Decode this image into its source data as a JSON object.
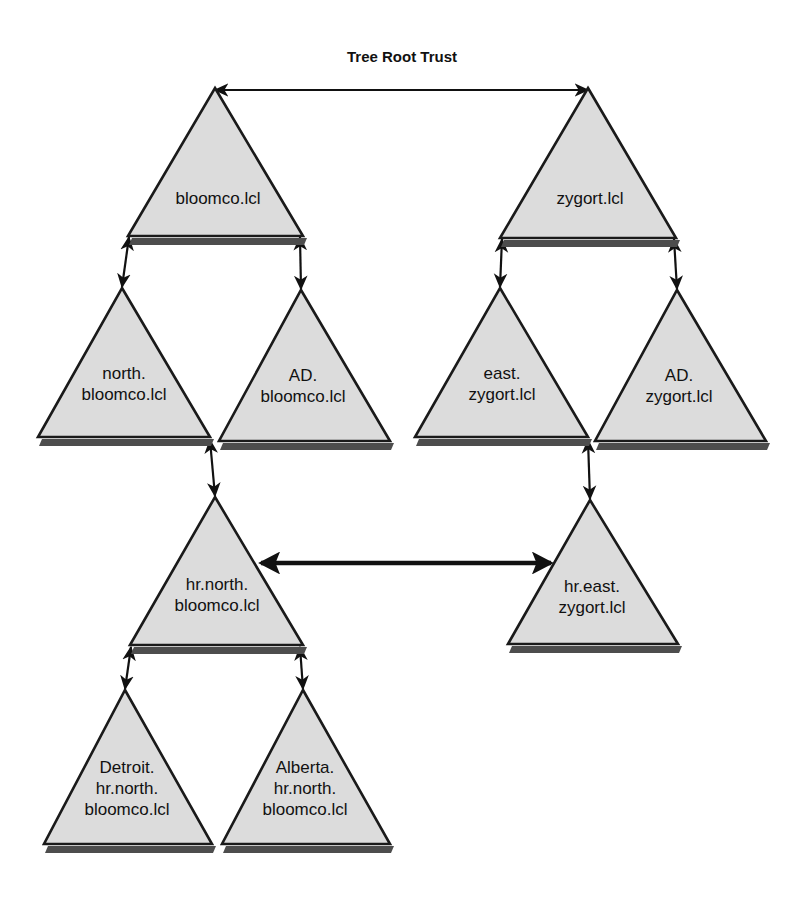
{
  "title": "Tree Root Trust",
  "domains": [
    {
      "id": "bloomco",
      "label_lines": [
        "bloomco.lcl"
      ],
      "apex": {
        "x": 215,
        "y": 88
      },
      "base_left": {
        "x": 128,
        "y": 236
      },
      "base_right": {
        "x": 303,
        "y": 236
      },
      "label_anchor": {
        "x": 218,
        "y": 200
      }
    },
    {
      "id": "zygort",
      "label_lines": [
        "zygort.lcl"
      ],
      "apex": {
        "x": 588,
        "y": 88
      },
      "base_left": {
        "x": 500,
        "y": 238
      },
      "base_right": {
        "x": 676,
        "y": 238
      },
      "label_anchor": {
        "x": 590,
        "y": 200
      }
    },
    {
      "id": "north-bloomco",
      "label_lines": [
        "north.",
        "bloomco.lcl"
      ],
      "apex": {
        "x": 122,
        "y": 288
      },
      "base_left": {
        "x": 38,
        "y": 437
      },
      "base_right": {
        "x": 210,
        "y": 437
      },
      "label_anchor": {
        "x": 124,
        "y": 385
      }
    },
    {
      "id": "ad-bloomco",
      "label_lines": [
        "AD.",
        "bloomco.lcl"
      ],
      "apex": {
        "x": 301,
        "y": 290
      },
      "base_left": {
        "x": 219,
        "y": 441
      },
      "base_right": {
        "x": 390,
        "y": 441
      },
      "label_anchor": {
        "x": 303,
        "y": 387
      }
    },
    {
      "id": "east-zygort",
      "label_lines": [
        "east.",
        "zygort.lcl"
      ],
      "apex": {
        "x": 500,
        "y": 288
      },
      "base_left": {
        "x": 415,
        "y": 437
      },
      "base_right": {
        "x": 588,
        "y": 437
      },
      "label_anchor": {
        "x": 502,
        "y": 385
      }
    },
    {
      "id": "ad-zygort",
      "label_lines": [
        "AD.",
        "zygort.lcl"
      ],
      "apex": {
        "x": 677,
        "y": 290
      },
      "base_left": {
        "x": 595,
        "y": 441
      },
      "base_right": {
        "x": 766,
        "y": 441
      },
      "label_anchor": {
        "x": 679,
        "y": 387
      }
    },
    {
      "id": "hr-north-bloomco",
      "label_lines": [
        "hr.north.",
        "bloomco.lcl"
      ],
      "apex": {
        "x": 215,
        "y": 497
      },
      "base_left": {
        "x": 130,
        "y": 645
      },
      "base_right": {
        "x": 303,
        "y": 645
      },
      "label_anchor": {
        "x": 217,
        "y": 596
      }
    },
    {
      "id": "hr-east-zygort",
      "label_lines": [
        "hr.east.",
        "zygort.lcl"
      ],
      "apex": {
        "x": 590,
        "y": 500
      },
      "base_left": {
        "x": 508,
        "y": 644
      },
      "base_right": {
        "x": 678,
        "y": 644
      },
      "label_anchor": {
        "x": 592,
        "y": 598
      }
    },
    {
      "id": "detroit-hr-north-bloomco",
      "label_lines": [
        "Detroit.",
        "hr.north.",
        "bloomco.lcl"
      ],
      "apex": {
        "x": 125,
        "y": 690
      },
      "base_left": {
        "x": 44,
        "y": 844
      },
      "base_right": {
        "x": 212,
        "y": 844
      },
      "label_anchor": {
        "x": 127,
        "y": 790
      }
    },
    {
      "id": "alberta-hr-north-bloomco",
      "label_lines": [
        "Alberta.",
        "hr.north.",
        "bloomco.lcl"
      ],
      "apex": {
        "x": 303,
        "y": 690
      },
      "base_left": {
        "x": 222,
        "y": 844
      },
      "base_right": {
        "x": 390,
        "y": 844
      },
      "label_anchor": {
        "x": 305,
        "y": 790
      }
    }
  ],
  "trusts": [
    {
      "id": "tree-root-trust",
      "kind": "horizontal-thin",
      "from": {
        "x": 215,
        "y": 90
      },
      "to": {
        "x": 588,
        "y": 90
      },
      "labelled": true
    },
    {
      "id": "bloomco-to-north",
      "kind": "vertical-thin",
      "from": {
        "x": 129,
        "y": 237
      },
      "to": {
        "x": 122,
        "y": 287
      }
    },
    {
      "id": "bloomco-to-ad",
      "kind": "vertical-thin",
      "from": {
        "x": 300,
        "y": 237
      },
      "to": {
        "x": 301,
        "y": 289
      }
    },
    {
      "id": "zygort-to-east",
      "kind": "vertical-thin",
      "from": {
        "x": 502,
        "y": 239
      },
      "to": {
        "x": 500,
        "y": 287
      }
    },
    {
      "id": "zygort-to-ad-zygort",
      "kind": "vertical-thin",
      "from": {
        "x": 674,
        "y": 239
      },
      "to": {
        "x": 677,
        "y": 289
      }
    },
    {
      "id": "north-to-hr-north",
      "kind": "vertical-thin",
      "from": {
        "x": 210,
        "y": 440
      },
      "to": {
        "x": 215,
        "y": 496
      }
    },
    {
      "id": "east-to-hr-east",
      "kind": "vertical-thin",
      "from": {
        "x": 588,
        "y": 440
      },
      "to": {
        "x": 590,
        "y": 499
      }
    },
    {
      "id": "hr-north-to-detroit",
      "kind": "vertical-thin",
      "from": {
        "x": 131,
        "y": 647
      },
      "to": {
        "x": 125,
        "y": 689
      }
    },
    {
      "id": "hr-north-to-alberta",
      "kind": "vertical-thin",
      "from": {
        "x": 300,
        "y": 647
      },
      "to": {
        "x": 303,
        "y": 689
      }
    },
    {
      "id": "shortcut-trust-hr-north-hr-east",
      "kind": "horizontal-thick",
      "from": {
        "x": 261,
        "y": 563
      },
      "to": {
        "x": 551,
        "y": 563
      }
    }
  ]
}
